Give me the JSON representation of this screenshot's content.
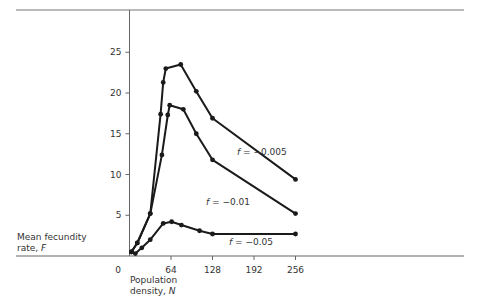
{
  "chart_data": {
    "type": "line",
    "title": "",
    "xlabel": "Population density, N",
    "xlabel_line1": "Population",
    "xlabel_line2_prefix": "density, ",
    "xlabel_var": "N",
    "ylabel": "Mean fecundity rate, F",
    "ylabel_line1": "Mean fecundity",
    "ylabel_line2_prefix": "rate, ",
    "ylabel_var": "F",
    "xlim": [
      0,
      256
    ],
    "ylim": [
      0,
      29
    ],
    "x_ticks": [
      0,
      64,
      128,
      192,
      256
    ],
    "y_ticks": [
      5,
      10,
      15,
      20,
      25
    ],
    "grid": false,
    "legend": "inline labels",
    "series": [
      {
        "name": "f = -0.005",
        "label_prefix": "f",
        "label_text": "= −0.005",
        "points": [
          [
            3,
            0.5
          ],
          [
            12,
            1.6
          ],
          [
            32,
            5.2
          ],
          [
            48,
            17.4
          ],
          [
            52,
            21.3
          ],
          [
            56,
            23.0
          ],
          [
            79,
            23.5
          ],
          [
            103,
            20.2
          ],
          [
            128,
            16.9
          ],
          [
            256,
            9.4
          ]
        ]
      },
      {
        "name": "f = -0.01",
        "label_prefix": "f",
        "label_text": "= −0.01",
        "points": [
          [
            3,
            0.5
          ],
          [
            12,
            1.6
          ],
          [
            32,
            5.2
          ],
          [
            50,
            12.4
          ],
          [
            59,
            17.3
          ],
          [
            62,
            18.5
          ],
          [
            83,
            18.0
          ],
          [
            103,
            15.0
          ],
          [
            128,
            11.8
          ],
          [
            256,
            5.2
          ]
        ]
      },
      {
        "name": "f = -0.05",
        "label_prefix": "f",
        "label_text": "= −0.05",
        "points": [
          [
            3,
            0.5
          ],
          [
            9,
            0.3
          ],
          [
            19,
            1.0
          ],
          [
            32,
            2.0
          ],
          [
            52,
            4.0
          ],
          [
            65,
            4.2
          ],
          [
            80,
            3.8
          ],
          [
            108,
            3.1
          ],
          [
            128,
            2.7
          ],
          [
            256,
            2.7
          ]
        ]
      }
    ]
  },
  "colors": {
    "line": "#1a1a1a",
    "axis": "#555555",
    "frame": "#777777"
  }
}
